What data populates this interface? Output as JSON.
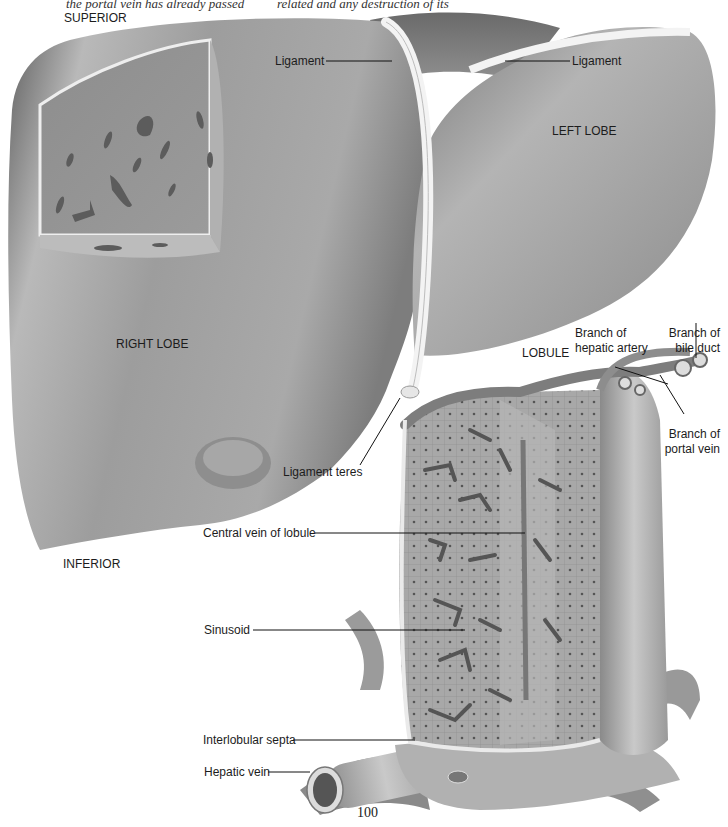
{
  "page": {
    "captions": [
      "the portal vein has already passed",
      "related and any destruction of its"
    ],
    "page_number": "100"
  },
  "orientation": {
    "superior": "SUPERIOR",
    "inferior": "INFERIOR"
  },
  "liver": {
    "right_lobe": "RIGHT LOBE",
    "left_lobe": "LEFT LOBE",
    "ligament_left_label": "Ligament",
    "ligament_right_label": "Ligament",
    "ligament_teres": "Ligament teres"
  },
  "lobule": {
    "title": "LOBULE",
    "labels": {
      "hepatic_artery": [
        "Branch of",
        "hepatic artery"
      ],
      "bile_duct": [
        "Branch of",
        "bile duct"
      ],
      "portal_vein": [
        "Branch of",
        "portal vein"
      ],
      "central_vein": "Central vein of lobule",
      "sinusoid": "Sinusoid",
      "interlobular_septa": "Interlobular septa",
      "hepatic_vein": "Hepatic vein"
    }
  },
  "colors": {
    "liver_dark": "#6e6e6e",
    "liver_mid": "#9a9a9a",
    "liver_light": "#c8c8c8",
    "ligament": "#f2f2f2",
    "label_line": "#111111"
  }
}
